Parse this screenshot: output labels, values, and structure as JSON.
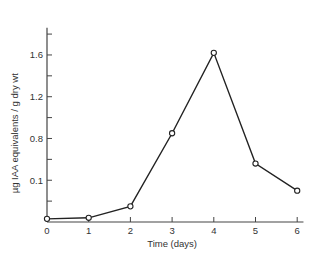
{
  "chart_data": {
    "type": "line",
    "title": "",
    "xlabel": "Time (days)",
    "ylabel": "µg IAA equivalents / g dry wt",
    "x": [
      0,
      1,
      2,
      3,
      4,
      5,
      6
    ],
    "categories": [
      "0",
      "1",
      "2",
      "3",
      "4",
      "5",
      "6"
    ],
    "series": [
      {
        "name": "IAA equivalents",
        "values": [
          0.03,
          0.04,
          0.15,
          0.85,
          1.62,
          0.56,
          0.3
        ],
        "marker": "open-circle"
      }
    ],
    "y_tick_labels": [
      {
        "value": 0.4,
        "label": "0.1"
      },
      {
        "value": 0.8,
        "label": "0.8"
      },
      {
        "value": 1.2,
        "label": "1.2"
      },
      {
        "value": 1.6,
        "label": "1.6"
      }
    ],
    "y_minor_ticks": [
      0.2,
      0.6,
      1.0,
      1.4,
      1.8
    ],
    "x_tick_labels": [
      "0",
      "1",
      "2",
      "3",
      "4",
      "5",
      "6"
    ],
    "xlim": [
      0,
      6.15
    ],
    "ylim": [
      0,
      1.86
    ],
    "grid": false,
    "legend": null
  },
  "colors": {
    "line": "#222222",
    "axis": "#444444",
    "text": "#333333",
    "background": "#ffffff"
  }
}
